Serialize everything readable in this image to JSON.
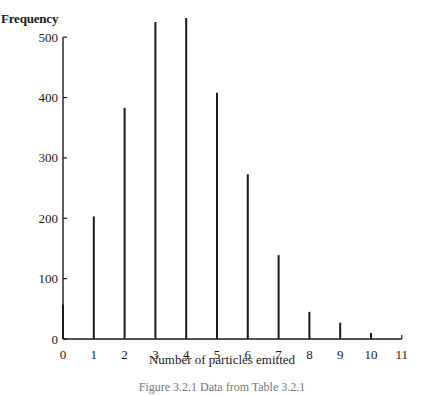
{
  "chart_data": {
    "type": "bar",
    "title": "",
    "xlabel": "Number of particles emitted",
    "ylabel": "Frequency",
    "caption": "Figure 3.2.1 Data from Table 3.2.1",
    "categories": [
      "0",
      "1",
      "2",
      "3",
      "4",
      "5",
      "6",
      "7",
      "8",
      "9",
      "10",
      "11"
    ],
    "values": [
      57,
      203,
      383,
      525,
      532,
      408,
      273,
      139,
      45,
      27,
      10,
      4
    ],
    "x_ticks": [
      "0",
      "1",
      "2",
      "3",
      "4",
      "5",
      "6",
      "7",
      "8",
      "9",
      "10",
      "11"
    ],
    "y_ticks": [
      0,
      100,
      200,
      300,
      400,
      500
    ],
    "ylim": [
      0,
      540
    ],
    "xlim": [
      0,
      11
    ],
    "grid": false,
    "legend": null,
    "style": "spike / line-bar chart"
  },
  "colors": {
    "bar": "#1a1a1a",
    "axis": "#1a1a1a",
    "background": "#ffffff"
  }
}
